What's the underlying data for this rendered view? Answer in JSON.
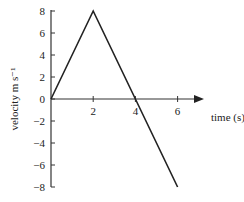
{
  "chart_data": {
    "type": "line",
    "title": "",
    "xlabel": "time (s)",
    "ylabel": "velocity m s⁻¹",
    "xlim": [
      0,
      6.5
    ],
    "ylim": [
      -8,
      8
    ],
    "grid": false,
    "legend": null,
    "x_ticks": [
      "2",
      "4",
      "6"
    ],
    "y_ticks": [
      "8",
      "6",
      "4",
      "2",
      "0",
      "−2",
      "−4",
      "−6",
      "−8"
    ],
    "series": [
      {
        "name": "velocity",
        "x": [
          0,
          2,
          4,
          6
        ],
        "y": [
          0,
          8,
          0,
          -8
        ]
      }
    ]
  }
}
